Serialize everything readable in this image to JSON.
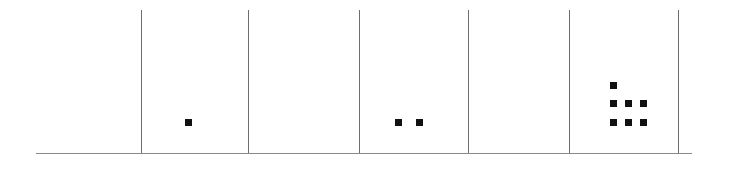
{
  "figure": {
    "background_color": "#ffffff",
    "axis_color": "#8a8a8a",
    "divider_color": "#6e6e6e",
    "dot_color": "#111111",
    "width": 739,
    "height": 172
  },
  "chart_data": {
    "type": "scatter",
    "subtype": "dot-plot",
    "title": "",
    "subtitle": "",
    "xlabel": "",
    "ylabel": "",
    "grid": false,
    "legend": null,
    "axis": {
      "baseline_y": 153,
      "baseline_x_start": 36,
      "baseline_x_end": 692,
      "tick_labels": [],
      "xlim": [
        36,
        692
      ],
      "ylim": [
        0,
        3
      ]
    },
    "dividers_x": [
      141,
      248,
      359,
      468,
      569,
      678
    ],
    "categories": [
      "bin-1",
      "bin-2",
      "bin-3",
      "bin-4",
      "bin-5",
      "bin-6"
    ],
    "values": [
      0,
      1,
      0,
      2,
      0,
      7
    ],
    "bins": [
      {
        "name": "bin-1",
        "x_start": 36,
        "x_end": 141,
        "count": 0,
        "dots": []
      },
      {
        "name": "bin-2",
        "x_start": 141,
        "x_end": 248,
        "count": 1,
        "dots": [
          {
            "x": 185,
            "y": 119,
            "row": 1,
            "col": 1
          }
        ]
      },
      {
        "name": "bin-3",
        "x_start": 248,
        "x_end": 359,
        "count": 0,
        "dots": []
      },
      {
        "name": "bin-4",
        "x_start": 359,
        "x_end": 468,
        "count": 2,
        "dots": [
          {
            "x": 395,
            "y": 119,
            "row": 1,
            "col": 1
          },
          {
            "x": 416,
            "y": 119,
            "row": 1,
            "col": 2
          }
        ]
      },
      {
        "name": "bin-5",
        "x_start": 468,
        "x_end": 569,
        "count": 0,
        "dots": []
      },
      {
        "name": "bin-6",
        "x_start": 569,
        "x_end": 678,
        "count": 7,
        "dots": [
          {
            "x": 610,
            "y": 82,
            "row": 3,
            "col": 1
          },
          {
            "x": 610,
            "y": 100,
            "row": 2,
            "col": 1
          },
          {
            "x": 625,
            "y": 100,
            "row": 2,
            "col": 2
          },
          {
            "x": 640,
            "y": 100,
            "row": 2,
            "col": 3
          },
          {
            "x": 610,
            "y": 119,
            "row": 1,
            "col": 1
          },
          {
            "x": 625,
            "y": 119,
            "row": 1,
            "col": 2
          },
          {
            "x": 640,
            "y": 119,
            "row": 1,
            "col": 3
          }
        ]
      },
      {
        "name": "bin-7",
        "x_start": 678,
        "x_end": 692,
        "count": 0,
        "dots": []
      }
    ],
    "annotations": []
  }
}
